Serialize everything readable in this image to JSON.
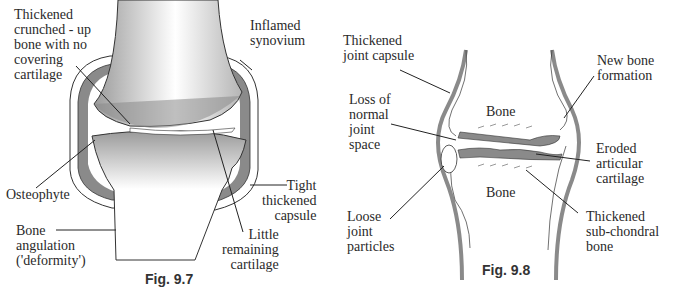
{
  "figures": [
    {
      "caption": "Fig. 9.7",
      "labels": {
        "thickened_bone": "Thickened\ncrunched - up\nbone with no\ncovering\ncartilage",
        "inflamed_synovium": "Inflamed\nsynovium",
        "osteophyte": "Osteophyte",
        "tight_capsule": "Tight\nthickened\ncapsule",
        "bone_angulation": "Bone\nangulation\n('deformity')",
        "little_cartilage": "Little\nremaining\ncartilage"
      }
    },
    {
      "caption": "Fig. 9.8",
      "labels": {
        "thickened_capsule": "Thickened\njoint capsule",
        "new_bone": "New bone\nformation",
        "loss_joint_space": "Loss of\nnormal\njoint\nspace",
        "bone_upper": "Bone",
        "eroded_cartilage": "Eroded\narticular\ncartilage",
        "bone_lower": "Bone",
        "loose_particles": "Loose\njoint\nparticles",
        "subchondral": "Thickened\nsub-chondral\nbone"
      }
    }
  ],
  "colors": {
    "tissue_grey": "#8a8a8a",
    "outline": "#333333",
    "background": "#ffffff"
  }
}
